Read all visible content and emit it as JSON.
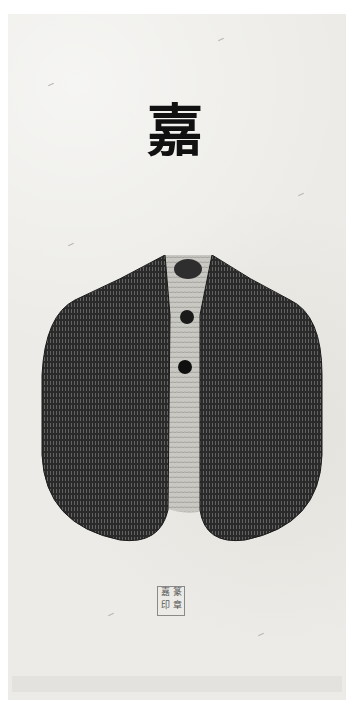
{
  "artwork": {
    "title_glyph": "嘉",
    "seal_chars": [
      "嘉",
      "篆",
      "印",
      "章"
    ],
    "colors": {
      "paper": "#ecebe7",
      "ink": "#111111",
      "vest_dark": "#2a2a2a",
      "vest_mid": "#5b5b5b",
      "center_light": "#c9c8c2"
    }
  }
}
